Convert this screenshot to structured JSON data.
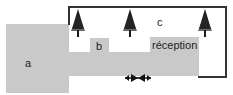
{
  "diagram": {
    "zones": [
      {
        "id": "a",
        "label": "a"
      },
      {
        "id": "b",
        "label": "b"
      },
      {
        "id": "c",
        "label": "c"
      },
      {
        "id": "reception",
        "label": "réception"
      }
    ],
    "trees": 3,
    "arrow_symbol": "converging-arrows",
    "colors": {
      "zone_fill": "#c9c9c9",
      "outline": "#333333",
      "tree": "#1a1a1a"
    }
  }
}
